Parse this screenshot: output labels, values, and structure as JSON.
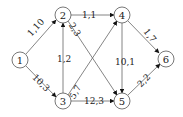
{
  "diagram": {
    "type": "directed-graph",
    "nodes": [
      {
        "id": "1",
        "label": "1",
        "x": 20,
        "y": 60
      },
      {
        "id": "2",
        "label": "2",
        "x": 63,
        "y": 15
      },
      {
        "id": "3",
        "label": "3",
        "x": 63,
        "y": 101
      },
      {
        "id": "4",
        "label": "4",
        "x": 122,
        "y": 15
      },
      {
        "id": "5",
        "label": "5",
        "x": 122,
        "y": 101
      },
      {
        "id": "6",
        "label": "6",
        "x": 166,
        "y": 59
      }
    ],
    "edges": [
      {
        "from": "1",
        "to": "2",
        "label": "1,10"
      },
      {
        "from": "1",
        "to": "3",
        "label": "10,3"
      },
      {
        "from": "3",
        "to": "2",
        "label": "1,2"
      },
      {
        "from": "2",
        "to": "4",
        "label": "1,1"
      },
      {
        "from": "2",
        "to": "5",
        "label": "2,3"
      },
      {
        "from": "3",
        "to": "4",
        "label": "5,7"
      },
      {
        "from": "3",
        "to": "5",
        "label": "12,3"
      },
      {
        "from": "4",
        "to": "5",
        "label": "10,1"
      },
      {
        "from": "4",
        "to": "6",
        "label": "1,7"
      },
      {
        "from": "5",
        "to": "6",
        "label": "2,2"
      }
    ]
  }
}
